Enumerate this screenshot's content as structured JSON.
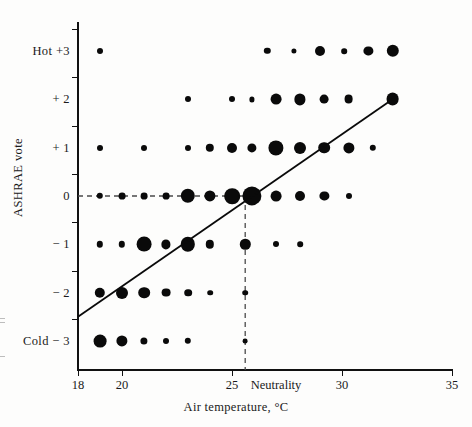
{
  "chart_data": {
    "type": "scatter",
    "title": "",
    "xlabel": "Air temperature, °C",
    "ylabel": "ASHRAE vote",
    "xlim": [
      18,
      35
    ],
    "ylim": [
      -3.6,
      3.6
    ],
    "grid": false,
    "legend": null,
    "x_ticks": [
      {
        "value": 18,
        "label": "18"
      },
      {
        "value": 20,
        "label": "20"
      },
      {
        "value": 25,
        "label": "25"
      },
      {
        "value": 30,
        "label": "30"
      },
      {
        "value": 35,
        "label": "35"
      }
    ],
    "y_ticks": [
      {
        "value": 3,
        "label": "Hot  +3"
      },
      {
        "value": 2,
        "label": "+ 2"
      },
      {
        "value": 1,
        "label": "+ 1"
      },
      {
        "value": 0,
        "label": "0"
      },
      {
        "value": -1,
        "label": "− 1"
      },
      {
        "value": -2,
        "label": "− 2"
      },
      {
        "value": -3,
        "label": "Cold  − 3"
      }
    ],
    "annotations": [
      {
        "name": "neutrality-label",
        "text": "Neutrality",
        "x": 27.0,
        "y": -3.9
      },
      {
        "name": "neutrality-vline",
        "x": 25.6,
        "style": "dashed",
        "from_y": 0,
        "to_y": -3.6
      },
      {
        "name": "neutrality-hline",
        "y": 0,
        "style": "dashed",
        "from_x": 18,
        "to_x": 25.6
      }
    ],
    "series": [
      {
        "name": "ASHRAE vote frequency bubbles",
        "marker": "filled-circle",
        "size_encodes": "number of respondents",
        "points": [
          {
            "x": 19,
            "y": 3,
            "r": 3.0
          },
          {
            "x": 26.6,
            "y": 3,
            "r": 3.2
          },
          {
            "x": 27.8,
            "y": 3,
            "r": 2.6
          },
          {
            "x": 29.0,
            "y": 3,
            "r": 5.0
          },
          {
            "x": 30.1,
            "y": 3,
            "r": 2.8
          },
          {
            "x": 31.2,
            "y": 3,
            "r": 4.6
          },
          {
            "x": 32.3,
            "y": 3,
            "r": 6.2
          },
          {
            "x": 23.0,
            "y": 2,
            "r": 3.0
          },
          {
            "x": 25.0,
            "y": 2,
            "r": 3.0
          },
          {
            "x": 25.9,
            "y": 2,
            "r": 2.6
          },
          {
            "x": 27.0,
            "y": 2,
            "r": 5.4
          },
          {
            "x": 28.1,
            "y": 2,
            "r": 5.6
          },
          {
            "x": 29.2,
            "y": 2,
            "r": 4.4
          },
          {
            "x": 30.3,
            "y": 2,
            "r": 4.4
          },
          {
            "x": 32.3,
            "y": 2,
            "r": 6.4
          },
          {
            "x": 19.0,
            "y": 1,
            "r": 3.0
          },
          {
            "x": 21.0,
            "y": 1,
            "r": 3.0
          },
          {
            "x": 23.0,
            "y": 1,
            "r": 3.0
          },
          {
            "x": 24.0,
            "y": 1,
            "r": 4.2
          },
          {
            "x": 25.0,
            "y": 1,
            "r": 5.0
          },
          {
            "x": 25.9,
            "y": 1,
            "r": 4.6
          },
          {
            "x": 27.0,
            "y": 1,
            "r": 7.6
          },
          {
            "x": 28.1,
            "y": 1,
            "r": 6.0
          },
          {
            "x": 29.2,
            "y": 1,
            "r": 5.8
          },
          {
            "x": 30.3,
            "y": 1,
            "r": 5.6
          },
          {
            "x": 31.4,
            "y": 1,
            "r": 3.2
          },
          {
            "x": 19.0,
            "y": 0,
            "r": 3.2
          },
          {
            "x": 20.0,
            "y": 0,
            "r": 3.4
          },
          {
            "x": 21.0,
            "y": 0,
            "r": 3.4
          },
          {
            "x": 22.0,
            "y": 0,
            "r": 3.4
          },
          {
            "x": 23.0,
            "y": 0,
            "r": 7.2
          },
          {
            "x": 24.0,
            "y": 0,
            "r": 5.6
          },
          {
            "x": 25.0,
            "y": 0,
            "r": 7.8
          },
          {
            "x": 25.9,
            "y": 0,
            "r": 9.6
          },
          {
            "x": 27.0,
            "y": 0,
            "r": 5.4
          },
          {
            "x": 28.1,
            "y": 0,
            "r": 5.0
          },
          {
            "x": 29.2,
            "y": 0,
            "r": 4.6
          },
          {
            "x": 30.3,
            "y": 0,
            "r": 3.0
          },
          {
            "x": 19.0,
            "y": -1,
            "r": 3.2
          },
          {
            "x": 20.0,
            "y": -1,
            "r": 3.2
          },
          {
            "x": 21.0,
            "y": -1,
            "r": 7.4
          },
          {
            "x": 22.0,
            "y": -1,
            "r": 4.6
          },
          {
            "x": 23.0,
            "y": -1,
            "r": 7.2
          },
          {
            "x": 24.0,
            "y": -1,
            "r": 4.2
          },
          {
            "x": 25.6,
            "y": -1,
            "r": 5.2
          },
          {
            "x": 27.0,
            "y": -1,
            "r": 3.0
          },
          {
            "x": 28.1,
            "y": -1,
            "r": 2.8
          },
          {
            "x": 19.0,
            "y": -2,
            "r": 5.2
          },
          {
            "x": 20.0,
            "y": -2,
            "r": 6.0
          },
          {
            "x": 21.0,
            "y": -2,
            "r": 5.8
          },
          {
            "x": 22.0,
            "y": -2,
            "r": 4.4
          },
          {
            "x": 23.0,
            "y": -2,
            "r": 3.8
          },
          {
            "x": 24.0,
            "y": -2,
            "r": 2.8
          },
          {
            "x": 25.6,
            "y": -2,
            "r": 2.8
          },
          {
            "x": 19.0,
            "y": -3,
            "r": 6.4
          },
          {
            "x": 20.0,
            "y": -3,
            "r": 5.6
          },
          {
            "x": 21.0,
            "y": -3,
            "r": 3.6
          },
          {
            "x": 22.0,
            "y": -3,
            "r": 3.0
          },
          {
            "x": 23.0,
            "y": -3,
            "r": 3.2
          },
          {
            "x": 25.6,
            "y": -3,
            "r": 2.4
          }
        ]
      },
      {
        "name": "regression line",
        "type": "line",
        "x": [
          18.0,
          32.3
        ],
        "y": [
          -2.5,
          2.0
        ]
      }
    ]
  }
}
